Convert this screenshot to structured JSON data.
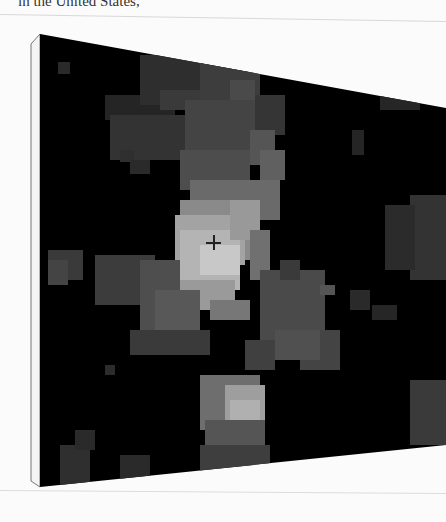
{
  "page": {
    "caption_fragment": "in the United States,"
  },
  "image": {
    "description": "canvas print of pixelated grayscale thermal/satellite map",
    "background_color": "#000000",
    "page_color": "#fbfbfb",
    "marker": "crosshair-icon"
  }
}
